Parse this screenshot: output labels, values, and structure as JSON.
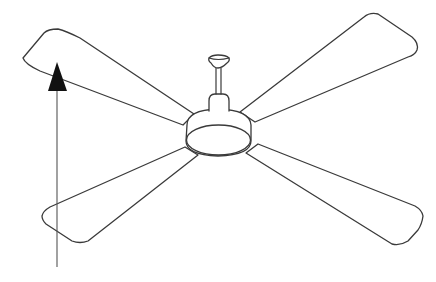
{
  "diagram": {
    "blade_count": 4,
    "annotation": "upward airflow arrow",
    "colors": {
      "background": "#ffffff",
      "outline": "#3a3a3a",
      "arrow": "#111111"
    }
  }
}
